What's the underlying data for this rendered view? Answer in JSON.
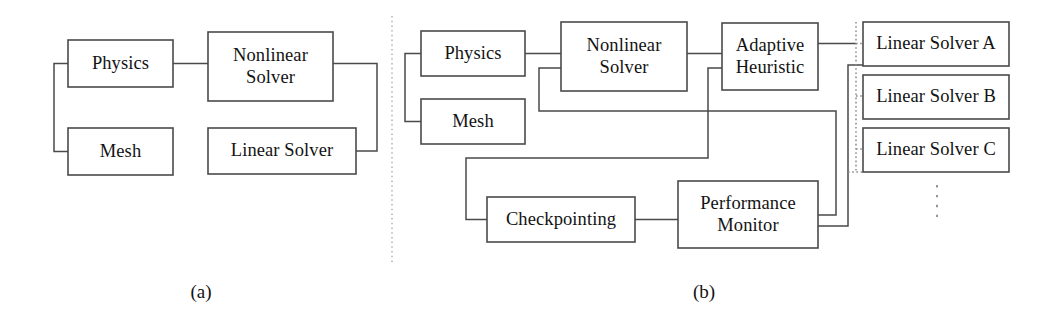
{
  "figure": {
    "background_color": "#ffffff",
    "line_color": "#4a4a4a",
    "dotted_color": "#8a8a8a",
    "divider_color": "#b4a8a8"
  },
  "panel_a": {
    "caption": "(a)",
    "caption_x": 201,
    "caption_y": 281,
    "boxes": [
      {
        "id": "physics_a",
        "label": "Physics",
        "x": 68,
        "y": 40,
        "w": 105,
        "h": 47
      },
      {
        "id": "mesh_a",
        "label": "Mesh",
        "x": 68,
        "y": 128,
        "w": 105,
        "h": 47
      },
      {
        "id": "nonlinear_a",
        "label": "Nonlinear\nSolver",
        "x": 208,
        "y": 32,
        "w": 125,
        "h": 69
      },
      {
        "id": "linear_solver_a",
        "label": "Linear Solver",
        "x": 208,
        "y": 128,
        "w": 148,
        "h": 46
      }
    ],
    "connectors": [
      {
        "id": "physics-to-nonlinear",
        "path": "M 173 63.5 L 208 63.5"
      },
      {
        "id": "physics-mesh-bracket",
        "path": "M 68 63.5 L 54 63.5 L 54 151.5 L 68 151.5"
      },
      {
        "id": "nonlinear-to-linear",
        "path": "M 333 63.5 L 377 63.5 L 377 151 L 356 151"
      }
    ]
  },
  "divider": {
    "id": "panel-divider",
    "x": 392,
    "y_top": 16,
    "y_bottom": 264
  },
  "panel_b": {
    "caption": "(b)",
    "caption_x": 704,
    "caption_y": 281,
    "boxes": [
      {
        "id": "physics_b",
        "label": "Physics",
        "x": 421,
        "y": 31,
        "w": 104,
        "h": 45
      },
      {
        "id": "mesh_b",
        "label": "Mesh",
        "x": 421,
        "y": 99,
        "w": 104,
        "h": 45
      },
      {
        "id": "nonlinear_b",
        "label": "Nonlinear\nSolver",
        "x": 561,
        "y": 22,
        "w": 126,
        "h": 69
      },
      {
        "id": "adaptive_heuristic",
        "label": "Adaptive\nHeuristic",
        "x": 722,
        "y": 23,
        "w": 96,
        "h": 67
      },
      {
        "id": "linear_solver_a_b",
        "label": "Linear Solver A",
        "x": 863,
        "y": 22,
        "w": 146,
        "h": 44
      },
      {
        "id": "linear_solver_b_b",
        "label": "Linear Solver B",
        "x": 863,
        "y": 75,
        "w": 146,
        "h": 44
      },
      {
        "id": "linear_solver_c_b",
        "label": "Linear Solver C",
        "x": 863,
        "y": 128,
        "w": 146,
        "h": 44
      },
      {
        "id": "checkpointing",
        "label": "Checkpointing",
        "x": 487,
        "y": 197,
        "w": 148,
        "h": 45
      },
      {
        "id": "performance_monitor",
        "label": "Performance\nMonitor",
        "x": 678,
        "y": 181,
        "w": 140,
        "h": 67
      }
    ],
    "connectors": [
      {
        "id": "physics-mesh-bracket-b",
        "path": "M 421 53.5 L 405 53.5 L 405 121.5 L 421 121.5"
      },
      {
        "id": "physics-to-nonlinear-b",
        "path": "M 525 53.5 L 561 53.5"
      },
      {
        "id": "nonlinear-to-adaptive",
        "path": "M 687 53.5 L 722 53.5"
      },
      {
        "id": "nonlinear-down-to-perf",
        "path": "M 561 68 L 539 68 L 539 111 L 836 111 L 836 215 L 818 215"
      },
      {
        "id": "adaptive-down-to-perf",
        "path": "M 722 68 L 708 68 L 708 158 L 466 158 L 466 219.5 L 487 219.5"
      },
      {
        "id": "checkpoint-to-perf",
        "path": "M 635 219.5 L 678 219.5"
      },
      {
        "id": "adaptive-to-solvers",
        "path": "M 818 43.5 L 856 43.5"
      },
      {
        "id": "perf-to-solvers",
        "path": "M 818 226 L 848 226 L 848 65 L 863 65"
      }
    ],
    "dotted_connectors": [
      {
        "id": "solver-bus-vertical",
        "path": "M 856 22 L 856 172"
      },
      {
        "id": "solver-bus-stub-a",
        "path": "M 856 43.5 L 863 43.5"
      },
      {
        "id": "solver-bus-stub-b",
        "path": "M 856 96 L 863 96"
      },
      {
        "id": "solver-bus-stub-c",
        "path": "M 856 149 L 863 149"
      },
      {
        "id": "solver-bus-stub-more",
        "path": "M 848 172 L 863 172"
      }
    ],
    "ellipsis": {
      "id": "more-solvers-ellipsis",
      "x": 937,
      "y_top": 185,
      "y_bottom": 219
    }
  }
}
